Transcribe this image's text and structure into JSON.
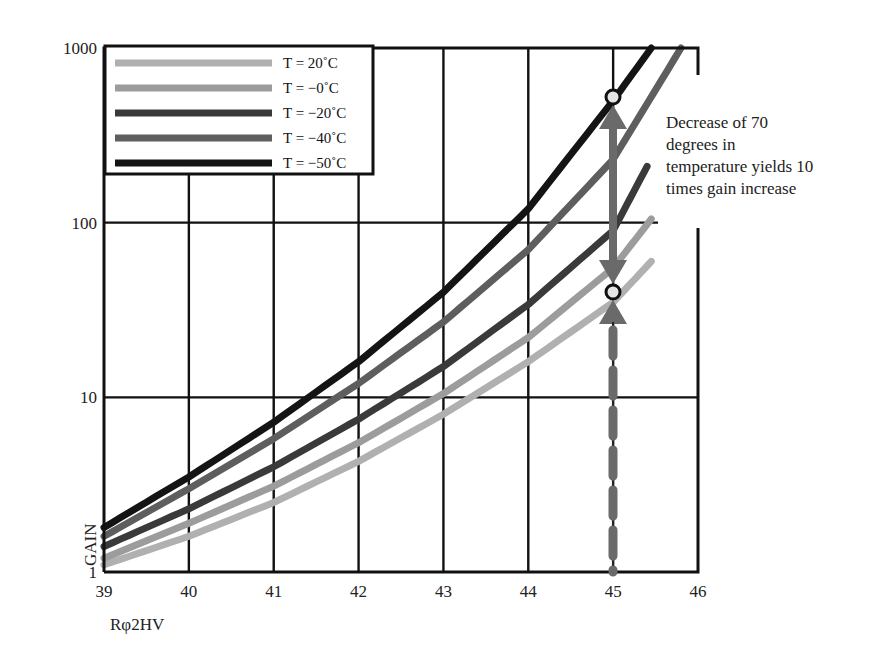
{
  "chart_data": {
    "type": "line",
    "title": "",
    "xlabel": "Rφ2HV",
    "ylabel": "GAIN",
    "xlim": [
      39,
      46
    ],
    "ylim": [
      1,
      1000
    ],
    "yscale": "log",
    "grid": true,
    "x_ticks": [
      "39",
      "40",
      "41",
      "42",
      "43",
      "44",
      "45",
      "46"
    ],
    "y_ticks": [
      "1",
      "10",
      "100",
      "1000"
    ],
    "legend_position": "upper-left",
    "series": [
      {
        "name": "T = 20˚C",
        "color": "#b0b0b0",
        "x": [
          39,
          40,
          41,
          42,
          43,
          44,
          45,
          45.45
        ],
        "y": [
          1.1,
          1.6,
          2.5,
          4.3,
          8,
          16,
          35,
          60
        ]
      },
      {
        "name": "T = −0˚C",
        "color": "#9c9c9c",
        "x": [
          39,
          40,
          41,
          42,
          43,
          44,
          45,
          45.45
        ],
        "y": [
          1.2,
          1.9,
          3.1,
          5.5,
          10.5,
          22,
          55,
          105
        ]
      },
      {
        "name": "T = −20˚C",
        "color": "#3a3a3a",
        "x": [
          39,
          40,
          41,
          42,
          43,
          44,
          45,
          45.4
        ],
        "y": [
          1.4,
          2.3,
          4.0,
          7.5,
          15,
          34,
          90,
          210
        ]
      },
      {
        "name": "T = −40˚C",
        "color": "#5e5e5e",
        "x": [
          39,
          40,
          41,
          42,
          43,
          44,
          45,
          45.8
        ],
        "y": [
          1.6,
          3.0,
          5.8,
          12,
          27,
          70,
          230,
          1000
        ]
      },
      {
        "name": "T = −50˚C",
        "color": "#141414",
        "x": [
          39,
          40,
          41,
          42,
          43,
          44,
          45,
          45.45
        ],
        "y": [
          1.8,
          3.5,
          7.2,
          16,
          40,
          120,
          500,
          1000
        ]
      }
    ],
    "annotations": [
      {
        "type": "double-arrow",
        "x": 45,
        "y_from": 40,
        "y_to": 500,
        "color": "#666666"
      },
      {
        "type": "marker",
        "shape": "circle",
        "x": 45,
        "y": 500
      },
      {
        "type": "marker",
        "shape": "circle",
        "x": 45,
        "y": 40
      },
      {
        "type": "dashed-arrow",
        "x": 45,
        "y_from": 1,
        "y_to": 40,
        "color": "#666666"
      },
      {
        "type": "text",
        "lines": [
          "Decrease of 70",
          "degrees in",
          "temperature yields 10",
          "times gain increase"
        ]
      }
    ]
  },
  "annotation": {
    "line1": "Decrease of 70",
    "line2": "degrees in",
    "line3": "temperature yields 10",
    "line4": "times gain increase"
  }
}
